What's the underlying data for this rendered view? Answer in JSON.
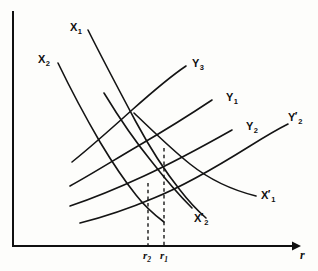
{
  "figure": {
    "domain": "diagram",
    "kind": "loanable-funds-curve-diagram",
    "background_color": "#fdfdfb",
    "line_color": "#141414",
    "width": 318,
    "height": 271
  },
  "axes": {
    "x_axis_label": "r",
    "y_axis_label": "",
    "origin": {
      "x": 13,
      "y": 246
    },
    "x_axis_end": {
      "x": 292,
      "y": 246
    },
    "y_axis_top": {
      "x": 13,
      "y": 12
    },
    "arrowhead": "x-axis-right-arrow"
  },
  "tick_marks": [
    {
      "id": "r2",
      "label": "r",
      "subscript": "2",
      "x": 148,
      "drop_top_y": 183,
      "drop_bottom_y": 246
    },
    {
      "id": "r1",
      "label": "r",
      "subscript": "1",
      "x": 164,
      "drop_top_y": 148,
      "drop_bottom_y": 246
    }
  ],
  "curves": [
    {
      "id": "X1",
      "name": "X1",
      "base": "X",
      "subscript": "1",
      "prime": false,
      "slope": "downward",
      "label_x": 70,
      "label_y": 22,
      "path": "M 88 30 C 104 62, 120 92, 136 122 C 150 148, 164 170, 180 190 C 190 203, 198 211, 206 218"
    },
    {
      "id": "X2",
      "name": "X2",
      "base": "X",
      "subscript": "2",
      "prime": false,
      "slope": "downward",
      "label_x": 38,
      "label_y": 54,
      "path": "M 58 63 C 72 92, 86 118, 100 142 C 112 162, 124 180, 136 195 C 146 208, 156 216, 164 222"
    },
    {
      "id": "X1p",
      "name": "X1'",
      "base": "X",
      "subscript": "1",
      "prime": true,
      "slope": "downward",
      "label_x": 261,
      "label_y": 190,
      "path": "M 134 113 C 152 130, 170 148, 190 164 C 210 180, 232 190, 256 196"
    },
    {
      "id": "X2p",
      "name": "X2'",
      "base": "X",
      "subscript": "2",
      "prime": true,
      "slope": "downward",
      "label_x": 194,
      "label_y": 213,
      "path": "M 104 93 C 118 116, 134 140, 152 162 C 166 180, 180 196, 192 208"
    },
    {
      "id": "Y3",
      "name": "Y3",
      "base": "Y",
      "subscript": "3",
      "prime": false,
      "slope": "upward",
      "label_x": 192,
      "label_y": 58,
      "path": "M 72 162 C 92 146, 112 128, 132 110 C 150 94, 168 78, 186 66"
    },
    {
      "id": "Y1",
      "name": "Y1",
      "base": "Y",
      "subscript": "1",
      "prime": false,
      "slope": "upward",
      "label_x": 226,
      "label_y": 92,
      "path": "M 70 186 C 92 174, 114 160, 138 146 C 162 132, 188 116, 212 100"
    },
    {
      "id": "Y2",
      "name": "Y2",
      "base": "Y",
      "subscript": "2",
      "prime": false,
      "slope": "upward",
      "label_x": 246,
      "label_y": 121,
      "path": "M 70 206 C 94 198, 118 188, 144 176 C 170 164, 200 148, 232 130"
    },
    {
      "id": "Y2p",
      "name": "Y2'",
      "base": "Y",
      "subscript": "2",
      "prime": true,
      "slope": "upward",
      "label_x": 288,
      "label_y": 112,
      "path": "M 80 223 C 104 217, 128 209, 154 198 C 184 186, 218 166, 250 146 C 266 136, 278 129, 288 124"
    }
  ],
  "intersections": [
    {
      "id": "eq-r1-upper",
      "description": "X1 crosses Y3",
      "x": 164,
      "y": 148
    },
    {
      "id": "eq-r1-lower",
      "description": "X2' crosses Y2",
      "x": 164,
      "y": 183
    },
    {
      "id": "eq-r2",
      "description": "X2 crosses Y1",
      "x": 148,
      "y": 170
    }
  ]
}
